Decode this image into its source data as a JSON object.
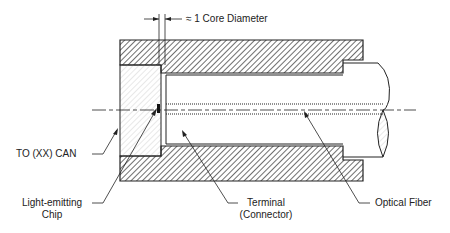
{
  "diagram": {
    "dimension_label": "≈ 1 Core Diameter",
    "labels": {
      "can": "TO (XX) CAN",
      "chip_line1": "Light-emitting",
      "chip_line2": "Chip",
      "terminal_line1": "Terminal",
      "terminal_line2": "(Connector)",
      "fiber": "Optical Fiber"
    },
    "components": [
      {
        "name": "housing",
        "style": "dense-hatch"
      },
      {
        "name": "to-can",
        "style": "light-hatch"
      },
      {
        "name": "terminal-connector",
        "style": "outline"
      },
      {
        "name": "optical-fiber",
        "style": "outline-with-broken-end"
      },
      {
        "name": "light-emitting-chip",
        "style": "solid-dot"
      },
      {
        "name": "optical-axis",
        "style": "dash-dot"
      }
    ],
    "colors": {
      "line": "#222222",
      "background": "#ffffff"
    }
  }
}
